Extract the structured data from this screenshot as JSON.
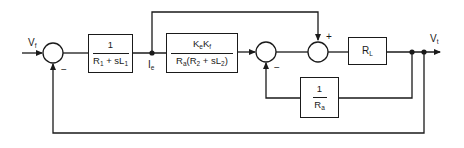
{
  "diagram": {
    "type": "block-diagram",
    "input": {
      "label": "V",
      "sub": "f"
    },
    "output": {
      "label": "V",
      "sub": "t"
    },
    "node_label": {
      "label": "I",
      "sub": "e"
    },
    "blocks": [
      {
        "id": "field",
        "num": "1",
        "den_parts": [
          {
            "t": "R"
          },
          {
            "s": "1"
          },
          {
            "t": " + sL"
          },
          {
            "s": "1"
          }
        ]
      },
      {
        "id": "armature",
        "num_parts": [
          {
            "t": "K"
          },
          {
            "s": "e"
          },
          {
            "t": "K"
          },
          {
            "s": "f"
          }
        ],
        "den_parts": [
          {
            "t": "R"
          },
          {
            "s": "a"
          },
          {
            "t": "(R"
          },
          {
            "s": "2"
          },
          {
            "t": " + sL"
          },
          {
            "s": "2"
          },
          {
            "t": ")"
          }
        ]
      },
      {
        "id": "load",
        "parts": [
          {
            "t": "R"
          },
          {
            "s": "L"
          }
        ]
      },
      {
        "id": "inner-feedback",
        "num": "1",
        "den_parts": [
          {
            "t": "R"
          },
          {
            "s": "a"
          }
        ]
      }
    ],
    "summing_junctions": [
      {
        "id": "sj1",
        "signs": {
          "feedback": "−"
        }
      },
      {
        "id": "sj2",
        "signs": {
          "feedback": "−"
        }
      },
      {
        "id": "sj3",
        "signs": {
          "top": "+"
        }
      }
    ]
  }
}
